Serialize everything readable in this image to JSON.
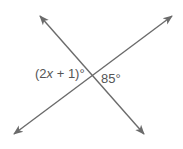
{
  "diagram": {
    "type": "intersecting-lines",
    "line_color": "#6b6b6b",
    "text_color": "#555555",
    "intersection": {
      "x": 92,
      "y": 77
    },
    "lines": [
      {
        "name": "line-descending",
        "from": {
          "x": 38,
          "y": 14
        },
        "to": {
          "x": 146,
          "y": 136
        },
        "arrows": "both"
      },
      {
        "name": "line-ascending",
        "from": {
          "x": 12,
          "y": 136
        },
        "to": {
          "x": 174,
          "y": 14
        },
        "arrows": "both"
      }
    ],
    "angles": {
      "left": {
        "label_prefix": "(2",
        "label_var": "x",
        "label_suffix": " + 1)°",
        "full": "(2x + 1)°"
      },
      "right": {
        "label": "85°"
      }
    }
  }
}
